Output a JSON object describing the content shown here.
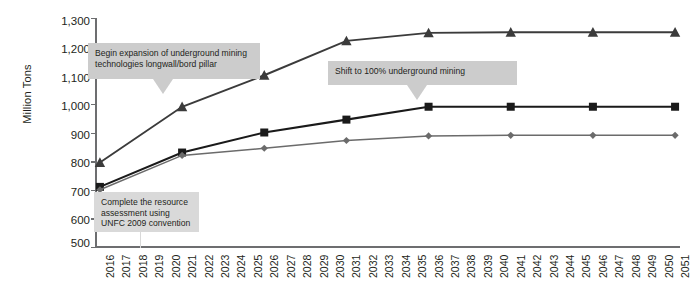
{
  "chart_data": {
    "type": "line",
    "title": "",
    "xlabel": "",
    "ylabel": "Million Tons",
    "ylim": [
      500,
      1300
    ],
    "ytick_values": [
      500,
      600,
      700,
      800,
      900,
      1000,
      1100,
      1200,
      1300
    ],
    "ytick_labels": [
      "500",
      "600",
      "700",
      "800",
      "900",
      "1,000",
      "1,100",
      "1,200",
      "1,300"
    ],
    "grid": false,
    "legend": "none",
    "categories": [
      "2016",
      "2017",
      "2018",
      "2019",
      "2020",
      "2021",
      "2022",
      "2023",
      "2024",
      "2025",
      "2026",
      "2027",
      "2028",
      "2029",
      "2030",
      "2031",
      "2032",
      "2033",
      "2034",
      "2035",
      "2036",
      "2037",
      "2038",
      "2039",
      "2040",
      "2041",
      "2042",
      "2043",
      "2044",
      "2045",
      "2046",
      "2047",
      "2048",
      "2049",
      "2050",
      "2051"
    ],
    "marker_years": [
      "2016",
      "2021",
      "2026",
      "2031",
      "2036",
      "2041",
      "2046",
      "2051"
    ],
    "series": [
      {
        "name": "upper-projection",
        "marker": "triangle",
        "color": "#3b3b3b",
        "x": [
          "2016",
          "2021",
          "2026",
          "2031",
          "2036",
          "2041",
          "2046",
          "2051"
        ],
        "values": [
          795,
          990,
          1100,
          1220,
          1248,
          1250,
          1250,
          1250
        ]
      },
      {
        "name": "middle-projection",
        "marker": "square",
        "color": "#1a1a1a",
        "x": [
          "2016",
          "2021",
          "2026",
          "2031",
          "2036",
          "2041",
          "2046",
          "2051"
        ],
        "values": [
          710,
          830,
          900,
          945,
          990,
          990,
          990,
          990
        ]
      },
      {
        "name": "lower-projection",
        "marker": "diamond",
        "color": "#6b6b6b",
        "x": [
          "2016",
          "2021",
          "2026",
          "2031",
          "2036",
          "2041",
          "2046",
          "2051"
        ],
        "values": [
          700,
          820,
          845,
          872,
          888,
          890,
          890,
          890
        ]
      }
    ],
    "annotations": [
      {
        "id": "annotation-underground-expansion",
        "text": "Begin expansion of underground mining technologies longwall/bord pillar",
        "points_to_year": "2021",
        "style": "box-with-down-arrow"
      },
      {
        "id": "annotation-shift-100-underground",
        "text": "Shift to 100% underground mining",
        "points_to_year": "2036",
        "style": "box-with-down-arrow"
      },
      {
        "id": "annotation-unfc-assessment",
        "text": "Complete the resource assessment using UNFC 2009 convention",
        "points_to_year": "2019",
        "style": "box-with-pointer-line"
      }
    ],
    "colors": {
      "axis": "#6d6e70",
      "annotation_box": "#cccccc",
      "annotation_box_light": "#d9d9d9",
      "text": "#231f20",
      "background": "#ffffff"
    }
  }
}
